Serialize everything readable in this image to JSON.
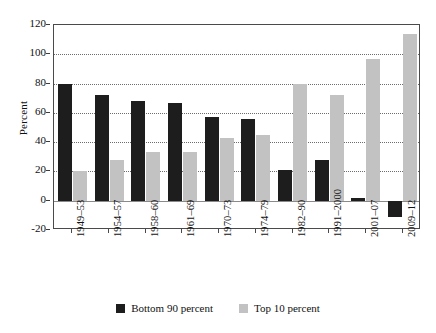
{
  "chart_data": {
    "type": "bar",
    "title": "",
    "xlabel": "",
    "ylabel": "Percent",
    "ylim": [
      -20,
      120
    ],
    "yticks": [
      -20,
      0,
      20,
      40,
      60,
      80,
      100,
      120
    ],
    "grid": true,
    "legend_position": "bottom",
    "categories": [
      "1949–53",
      "1954–57",
      "1958–60",
      "1961–69",
      "1970–73",
      "1974–79",
      "1982–90",
      "1991–2000",
      "2001–07",
      "2009–12"
    ],
    "series": [
      {
        "name": "Bottom 90 percent",
        "color": "#1d1d1d",
        "values": [
          80,
          72,
          68,
          67,
          57,
          56,
          21,
          28,
          2,
          -11
        ]
      },
      {
        "name": "Top 10 percent",
        "color": "#c2c2c2",
        "values": [
          20,
          28,
          33,
          33,
          43,
          45,
          80,
          72,
          97,
          114
        ]
      }
    ]
  },
  "axis": {
    "y_title": "Percent",
    "y_tick_labels": [
      "120",
      "100",
      "80",
      "60",
      "40",
      "20",
      "0",
      "-20"
    ]
  },
  "legend": {
    "items": [
      {
        "label": "Bottom 90 percent",
        "swatch": "dark-square-swatch"
      },
      {
        "label": "Top 10 percent",
        "swatch": "light-square-swatch"
      }
    ]
  }
}
